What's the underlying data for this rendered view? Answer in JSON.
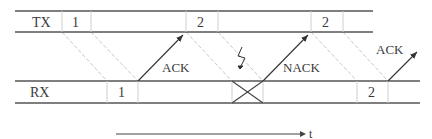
{
  "diagram": {
    "type": "stop-and-wait HARQ timing",
    "tx_lane": {
      "label": "TX",
      "slots": [
        {
          "id": "tx-1",
          "text": "1"
        },
        {
          "id": "tx-2a",
          "text": "2"
        },
        {
          "id": "tx-2b",
          "text": "2"
        }
      ]
    },
    "rx_lane": {
      "label": "RX",
      "slots": [
        {
          "id": "rx-1",
          "text": "1"
        },
        {
          "id": "rx-lost",
          "text": ""
        },
        {
          "id": "rx-2",
          "text": "2"
        }
      ]
    },
    "feedback": {
      "ack1": "ACK",
      "nack": "NACK",
      "ack2": "ACK"
    },
    "error_symbol": "lightning-bolt",
    "time_axis": {
      "label": "t"
    },
    "colors": {
      "lines": "#555555",
      "guide_lines": "#c8c8c8",
      "text": "#3a3a3a"
    }
  }
}
